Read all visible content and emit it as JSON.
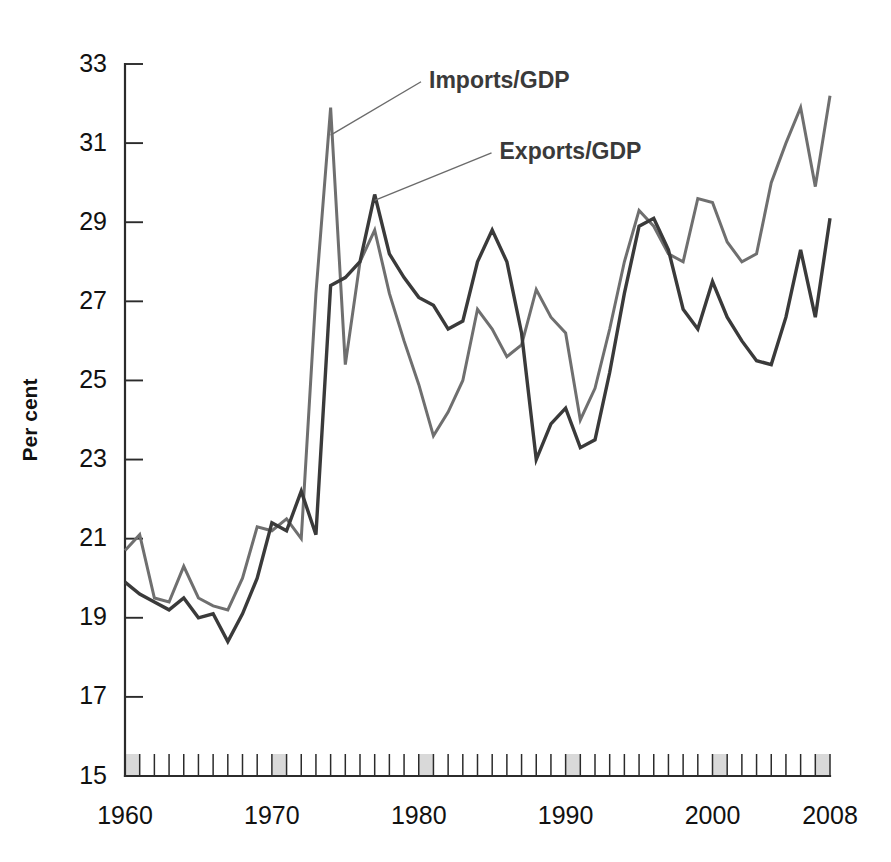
{
  "chart_data": {
    "type": "line",
    "title": "",
    "xlabel": "",
    "ylabel": "Per cent",
    "xlim": [
      1960,
      2008
    ],
    "ylim": [
      15,
      33
    ],
    "grid": false,
    "legend_position": "inline-annotations",
    "y_ticks": [
      15,
      17,
      19,
      21,
      23,
      25,
      27,
      29,
      31,
      33
    ],
    "x_ticks": [
      1960,
      1970,
      1980,
      1990,
      2000,
      2008
    ],
    "x_tick_labels": [
      "1960",
      "1970",
      "1980",
      "1990",
      "2000",
      "2008"
    ],
    "x_minor_tick_step": 1,
    "x": [
      1960,
      1961,
      1962,
      1963,
      1964,
      1965,
      1966,
      1967,
      1968,
      1969,
      1970,
      1971,
      1972,
      1973,
      1974,
      1975,
      1976,
      1977,
      1978,
      1979,
      1980,
      1981,
      1982,
      1983,
      1984,
      1985,
      1986,
      1987,
      1988,
      1989,
      1990,
      1991,
      1992,
      1993,
      1994,
      1995,
      1996,
      1997,
      1998,
      1999,
      2000,
      2001,
      2002,
      2003,
      2004,
      2005,
      2006,
      2007,
      2008
    ],
    "series": [
      {
        "name": "Imports/GDP",
        "color": "#6f6f6f",
        "values": [
          20.7,
          21.1,
          19.5,
          19.4,
          20.3,
          19.5,
          19.3,
          19.2,
          20.0,
          21.3,
          21.2,
          21.5,
          21.0,
          27.2,
          31.9,
          25.4,
          28.0,
          28.8,
          27.2,
          26.0,
          24.9,
          23.6,
          24.2,
          25.0,
          26.8,
          26.3,
          25.6,
          25.9,
          27.3,
          26.6,
          26.2,
          24.0,
          24.8,
          26.3,
          28.0,
          29.3,
          28.9,
          28.2,
          28.0,
          29.6,
          29.5,
          28.5,
          28.0,
          28.2,
          30.0,
          31.0,
          31.9,
          29.9,
          32.2
        ]
      },
      {
        "name": "Exports/GDP",
        "color": "#3a3a3a",
        "values": [
          19.9,
          19.6,
          19.4,
          19.2,
          19.5,
          19.0,
          19.1,
          18.4,
          19.1,
          20.0,
          21.4,
          21.2,
          22.2,
          21.1,
          27.4,
          27.6,
          28.0,
          29.7,
          28.2,
          27.6,
          27.1,
          26.9,
          26.3,
          26.5,
          28.0,
          28.8,
          28.0,
          26.2,
          23.0,
          23.9,
          24.3,
          23.3,
          23.5,
          25.2,
          27.2,
          28.9,
          29.1,
          28.3,
          26.8,
          26.3,
          27.5,
          26.6,
          26.0,
          25.5,
          25.4,
          26.6,
          28.3,
          26.6,
          29.1
        ]
      }
    ],
    "annotations": [
      {
        "text": "Imports/GDP",
        "label_x": 1980.7,
        "label_y": 32.4,
        "target_x": 1974.0,
        "target_y": 31.2
      },
      {
        "text": "Exports/GDP",
        "label_x": 1985.5,
        "label_y": 30.6,
        "target_x": 1977.0,
        "target_y": 29.55
      }
    ]
  },
  "colors": {
    "imports_line": "#6f6f6f",
    "exports_line": "#3a3a3a",
    "axis": "#2b2b2b",
    "tick_shade": "#d9d9d9",
    "background": "#ffffff",
    "annotation_text": "#3a3a3a"
  }
}
